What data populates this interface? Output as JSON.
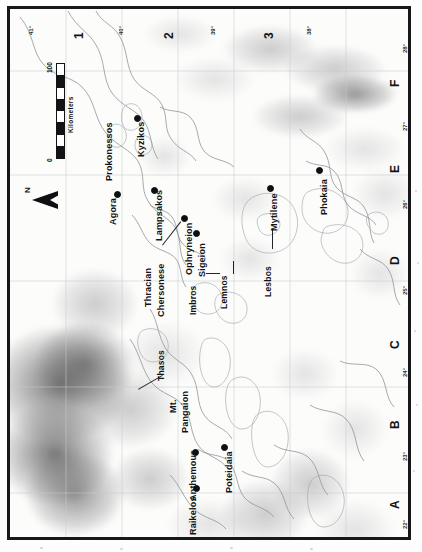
{
  "map": {
    "orientation_note": "plate rotated 90 degrees",
    "north_arrow_label": "N",
    "scale": {
      "start_label": "0",
      "end_label": "100",
      "units_label": "Kilometers",
      "segments": 8
    },
    "settlements": [
      {
        "name": "Kyzikos",
        "x": 124,
        "y": 106
      },
      {
        "name": "Agora",
        "x": 104,
        "y": 182
      },
      {
        "name": "Lampsakos",
        "x": 141,
        "y": 178
      },
      {
        "name": "Ophryneion",
        "x": 171,
        "y": 206
      },
      {
        "name": "Sigeion",
        "x": 183,
        "y": 221
      },
      {
        "name": "Mytilene",
        "x": 257,
        "y": 176
      },
      {
        "name": "Phokaia",
        "x": 306,
        "y": 158
      },
      {
        "name": "Anthemous",
        "x": 182,
        "y": 440
      },
      {
        "name": "Poteidaia",
        "x": 211,
        "y": 435
      },
      {
        "name": "Raikelos",
        "x": 183,
        "y": 476
      }
    ],
    "regions": [
      {
        "name": "Prokonessos",
        "x": 94,
        "y": 120
      },
      {
        "name": "Thracian",
        "x": 133,
        "y": 238
      },
      {
        "name": "Chersonese",
        "x": 146,
        "y": 238
      },
      {
        "name": "Imbros",
        "x": 177,
        "y": 272
      },
      {
        "name": "Lemnos",
        "x": 207,
        "y": 258
      },
      {
        "name": "Lesbos",
        "x": 251,
        "y": 244
      },
      {
        "name": "Thasos",
        "x": 145,
        "y": 330
      },
      {
        "name": "Mt.",
        "x": 157,
        "y": 377
      },
      {
        "name": "Pangaion",
        "x": 169,
        "y": 369
      }
    ],
    "grid": {
      "letters": [
        "A",
        "B",
        "C",
        "D",
        "E",
        "F"
      ],
      "numbers": [
        "1",
        "2",
        "3"
      ],
      "lon_labels": [
        "22°",
        "23°",
        "24°",
        "25°",
        "26°",
        "27°",
        "28°"
      ],
      "lat_labels": [
        "41°",
        "40°",
        "39°",
        "38°"
      ]
    }
  }
}
